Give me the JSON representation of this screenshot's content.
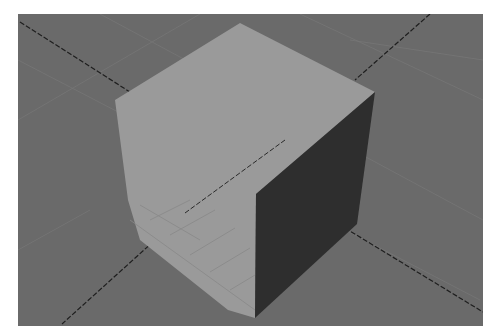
{
  "scene": {
    "subject": "3D cube on a ground grid",
    "colors": {
      "background": "#6a6a6a",
      "light_face": "#9a9a9a",
      "dark_face": "#2e2e2e",
      "axis_line": "#1e1e1e",
      "grid_line": "#7a7a7a"
    }
  }
}
